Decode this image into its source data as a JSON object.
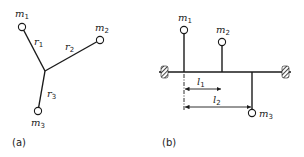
{
  "figure_a": {
    "caption": "(a)",
    "masses": [
      {
        "name": "m",
        "sub": "1"
      },
      {
        "name": "m",
        "sub": "2"
      },
      {
        "name": "m",
        "sub": "3"
      }
    ],
    "arms": [
      {
        "name": "r",
        "sub": "1"
      },
      {
        "name": "r",
        "sub": "2"
      },
      {
        "name": "r",
        "sub": "3"
      }
    ]
  },
  "figure_b": {
    "caption": "(b)",
    "masses": [
      {
        "name": "m",
        "sub": "1"
      },
      {
        "name": "m",
        "sub": "2"
      },
      {
        "name": "m",
        "sub": "3"
      }
    ],
    "dimensions": [
      {
        "name": "l",
        "sub": "1"
      },
      {
        "name": "l",
        "sub": "2"
      }
    ]
  },
  "colors": {
    "line": "#1a1a1a",
    "background": "#ffffff"
  }
}
